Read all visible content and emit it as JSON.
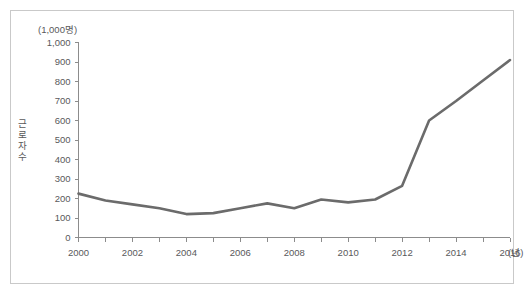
{
  "figure": {
    "unit_label": "(1,000명)",
    "y_axis_title_chars": [
      "근",
      "로",
      "자",
      "수"
    ],
    "x_axis_unit": "(년)"
  },
  "chart_data": {
    "type": "line",
    "title": "",
    "subtitle": "",
    "xlabel": "(년)",
    "ylabel": "근로자 수",
    "unit": "(1,000명)",
    "grid": false,
    "legend": "none",
    "xlim": [
      2000,
      2016
    ],
    "ylim": [
      0,
      1000
    ],
    "y_tick_step": 100,
    "x_tick_step": 1,
    "x_tick_label_step": 2,
    "y_ticks": [
      0,
      100,
      200,
      300,
      400,
      500,
      600,
      700,
      800,
      900,
      1000
    ],
    "y_tick_labels": [
      "0",
      "100",
      "200",
      "300",
      "400",
      "500",
      "600",
      "700",
      "800",
      "900",
      "1,000"
    ],
    "x_ticks": [
      2000,
      2001,
      2002,
      2003,
      2004,
      2005,
      2006,
      2007,
      2008,
      2009,
      2010,
      2011,
      2012,
      2013,
      2014,
      2015,
      2016
    ],
    "x_tick_labels": [
      "2000",
      "",
      "2002",
      "",
      "2004",
      "",
      "2006",
      "",
      "2008",
      "",
      "2010",
      "",
      "2012",
      "",
      "2014",
      "",
      "2016"
    ],
    "x": [
      2000,
      2001,
      2002,
      2003,
      2004,
      2005,
      2006,
      2007,
      2008,
      2009,
      2010,
      2011,
      2012,
      2013,
      2014,
      2015,
      2016
    ],
    "values": [
      225,
      190,
      170,
      150,
      120,
      125,
      150,
      175,
      150,
      195,
      180,
      195,
      265,
      600,
      700,
      805,
      910
    ],
    "series": [
      {
        "name": "근로자 수",
        "color": "#6b6b6b",
        "values": [
          225,
          190,
          170,
          150,
          120,
          125,
          150,
          175,
          150,
          195,
          180,
          195,
          265,
          600,
          700,
          805,
          910
        ]
      }
    ]
  }
}
